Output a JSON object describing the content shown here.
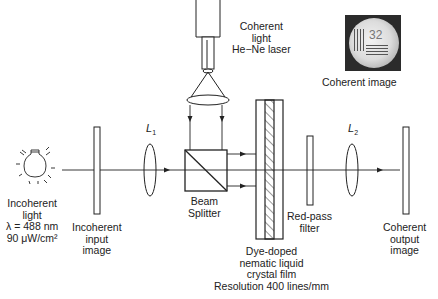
{
  "diagram": {
    "type": "optical-setup",
    "stroke_color": "#222222",
    "background": "#ffffff"
  },
  "labels": {
    "laser": [
      "Coherent",
      "light",
      "He−Ne laser"
    ],
    "coherent_image_caption": "Coherent image",
    "lens1": {
      "letter": "L",
      "sub": "1"
    },
    "lens2": {
      "letter": "L",
      "sub": "2"
    },
    "source": [
      "Incoherent",
      "light",
      "λ = 488 nm",
      "90 μW/cm²"
    ],
    "input_image": [
      "Incoherent",
      "input",
      "image"
    ],
    "beam_splitter": [
      "Beam",
      "Splitter"
    ],
    "red_filter": [
      "Red-pass",
      "filter"
    ],
    "lc_film": [
      "Dye-doped",
      "nematic liquid",
      "crystal film",
      "Resolution 400 lines/mm"
    ],
    "output_image": [
      "Coherent",
      "output",
      "image"
    ]
  },
  "coherent_image_photo": {
    "digits": "32"
  }
}
